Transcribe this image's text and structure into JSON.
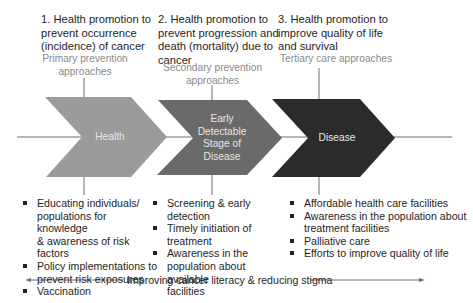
{
  "diagram": {
    "stages": [
      {
        "title_lines": [
          "1. Health promotion to",
          "prevent occurrence",
          "(incidence)  of cancer"
        ],
        "subtitle_lines": [
          "Primary prevention",
          "approaches"
        ],
        "chevron_label_lines": [
          "Health"
        ],
        "chevron_color": "#9b9b9b",
        "bullets": [
          {
            "lines": [
              "Educating individuals/",
              "populations for knowledge",
              "& awareness of risk factors"
            ]
          },
          {
            "lines": [
              "Policy implementations to",
              "prevent risk exposures"
            ]
          },
          {
            "lines": [
              "Vaccination"
            ]
          }
        ]
      },
      {
        "title_lines": [
          "2. Health promotion to",
          "prevent progression and",
          "death (mortality) due to",
          "cancer"
        ],
        "subtitle_lines": [
          "Secondary prevention",
          "approaches"
        ],
        "chevron_label_lines": [
          "Early",
          "Detectable",
          "Stage of",
          "Disease"
        ],
        "chevron_color": "#6a6a6a",
        "bullets": [
          {
            "lines": [
              "Screening & early detection"
            ]
          },
          {
            "lines": [
              "Timely initiation of",
              "treatment"
            ]
          },
          {
            "lines": [
              "Awareness in the",
              "population about available",
              "facilities"
            ]
          }
        ]
      },
      {
        "title_lines": [
          "3. Health promotion to",
          "improve quality of life",
          "and survival"
        ],
        "subtitle_lines": [
          "Tertiary care approaches"
        ],
        "chevron_label_lines": [
          "Disease"
        ],
        "chevron_color": "#2b2b2b",
        "bullets": [
          {
            "lines": [
              "Affordable health care facilities"
            ]
          },
          {
            "lines": [
              "Awareness in the population about",
              "treatment facilities"
            ]
          },
          {
            "lines": [
              "Palliative care"
            ]
          },
          {
            "lines": [
              "Efforts to improve quality of life"
            ]
          }
        ]
      }
    ],
    "footer": {
      "label": "Improving cancer literacy & reducing stigma",
      "arrow": "double-headed"
    },
    "colors": {
      "line": "#6e6e6e",
      "subtitle_text": "#8a8a8a",
      "chevron_text": "#e6e6e6"
    }
  }
}
